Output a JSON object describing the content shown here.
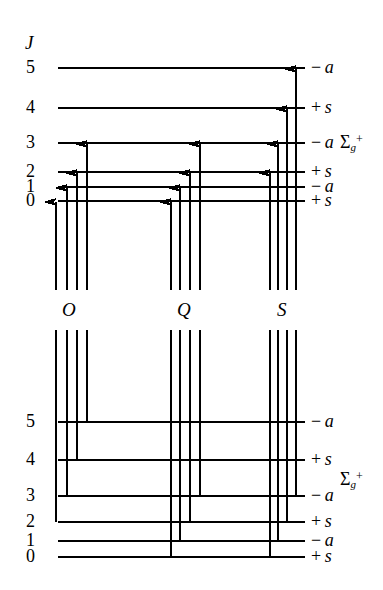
{
  "figure": {
    "axis_label": "J",
    "stroke_color": "#000000",
    "background": "#ffffff"
  },
  "upper": {
    "name": "upper-state-manifold",
    "term_symbol": {
      "sigma": "Σ",
      "sub": "g",
      "sup": "+"
    },
    "levels": [
      {
        "J": "5",
        "parity_sign": "−",
        "parity_letter": "a",
        "y": 68
      },
      {
        "J": "4",
        "parity_sign": "+",
        "parity_letter": "s",
        "y": 108
      },
      {
        "J": "3",
        "parity_sign": "−",
        "parity_letter": "a",
        "y": 143
      },
      {
        "J": "2",
        "parity_sign": "+",
        "parity_letter": "s",
        "y": 172
      },
      {
        "J": "1",
        "parity_sign": "−",
        "parity_letter": "a",
        "y": 187
      },
      {
        "J": "0",
        "parity_sign": "+",
        "parity_letter": "s",
        "y": 201
      }
    ],
    "line_x_start": 58,
    "line_x_end": 305
  },
  "lower": {
    "name": "lower-state-manifold",
    "term_symbol": {
      "sigma": "Σ",
      "sub": "g",
      "sup": "+"
    },
    "levels": [
      {
        "J": "5",
        "parity_sign": "−",
        "parity_letter": "a",
        "y": 422
      },
      {
        "J": "4",
        "parity_sign": "+",
        "parity_letter": "s",
        "y": 460
      },
      {
        "J": "3",
        "parity_sign": "−",
        "parity_letter": "a",
        "y": 496
      },
      {
        "J": "2",
        "parity_sign": "+",
        "parity_letter": "s",
        "y": 522
      },
      {
        "J": "1",
        "parity_sign": "−",
        "parity_letter": "a",
        "y": 541
      },
      {
        "J": "0",
        "parity_sign": "+",
        "parity_letter": "s",
        "y": 557
      }
    ],
    "line_x_start": 58,
    "line_x_end": 305
  },
  "branches": [
    {
      "label": "O",
      "x": 68,
      "label_y": 312
    },
    {
      "label": "Q",
      "x": 183,
      "label_y": 312
    },
    {
      "label": "S",
      "x": 283,
      "label_y": 312
    }
  ],
  "chart_data": {
    "type": "diagram",
    "ylabel": "J",
    "upper_levels": [
      5,
      4,
      3,
      2,
      1,
      0
    ],
    "lower_levels": [
      5,
      4,
      3,
      2,
      1,
      0
    ],
    "parity_sequence": [
      "-a",
      "+s",
      "-a",
      "+s",
      "-a",
      "+s"
    ],
    "transitions": [
      {
        "branch": "O",
        "x": 56,
        "upper_J": 0,
        "lower_J": 2,
        "arrow_top_y": 201,
        "line_bottom_y": 522
      },
      {
        "branch": "O",
        "x": 67,
        "upper_J": 1,
        "lower_J": 3,
        "arrow_top_y": 187,
        "line_bottom_y": 496
      },
      {
        "branch": "O",
        "x": 77,
        "upper_J": 2,
        "lower_J": 4,
        "arrow_top_y": 172,
        "line_bottom_y": 460
      },
      {
        "branch": "O",
        "x": 87,
        "upper_J": 3,
        "lower_J": 5,
        "arrow_top_y": 143,
        "line_bottom_y": 422
      },
      {
        "branch": "Q",
        "x": 171,
        "upper_J": 0,
        "lower_J": 0,
        "arrow_top_y": 201,
        "line_bottom_y": 557
      },
      {
        "branch": "Q",
        "x": 180,
        "upper_J": 1,
        "lower_J": 1,
        "arrow_top_y": 187,
        "line_bottom_y": 541
      },
      {
        "branch": "Q",
        "x": 190,
        "upper_J": 2,
        "lower_J": 2,
        "arrow_top_y": 172,
        "line_bottom_y": 522
      },
      {
        "branch": "Q",
        "x": 200,
        "upper_J": 3,
        "lower_J": 3,
        "arrow_top_y": 143,
        "line_bottom_y": 496
      },
      {
        "branch": "S",
        "x": 270,
        "upper_J": 2,
        "lower_J": 0,
        "arrow_top_y": 172,
        "line_bottom_y": 557
      },
      {
        "branch": "S",
        "x": 278,
        "upper_J": 3,
        "lower_J": 1,
        "arrow_top_y": 143,
        "line_bottom_y": 541
      },
      {
        "branch": "S",
        "x": 287,
        "upper_J": 4,
        "lower_J": 2,
        "arrow_top_y": 108,
        "line_bottom_y": 522
      },
      {
        "branch": "S",
        "x": 296,
        "upper_J": 5,
        "lower_J": 3,
        "arrow_top_y": 68,
        "line_bottom_y": 496
      }
    ],
    "gap_top_y": 290,
    "gap_bottom_y": 330
  }
}
